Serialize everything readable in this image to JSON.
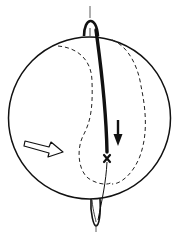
{
  "diagram": {
    "type": "sphere-rotation-illustration",
    "colors": {
      "background": "#ffffff",
      "stroke": "#111111"
    },
    "elements": [
      {
        "name": "sphere-outline",
        "shape": "circle",
        "style": "solid"
      },
      {
        "name": "rotation-axis-top-lobe",
        "shape": "loop",
        "style": "solid"
      },
      {
        "name": "rotation-axis-bottom-lobe",
        "shape": "loop",
        "style": "solid"
      },
      {
        "name": "meridian-line-thick",
        "shape": "curve",
        "style": "bold-solid"
      },
      {
        "name": "meridian-line-thin",
        "shape": "curve",
        "style": "thin-solid"
      },
      {
        "name": "dashed-boundary-left",
        "shape": "curve",
        "style": "dashed"
      },
      {
        "name": "dashed-boundary-right",
        "shape": "curve",
        "style": "dashed"
      },
      {
        "name": "flow-arrow",
        "shape": "hollow-arrow",
        "direction": "right"
      },
      {
        "name": "downward-arrow",
        "shape": "solid-arrow",
        "direction": "down"
      },
      {
        "name": "cross-marker",
        "shape": "x-mark"
      }
    ]
  }
}
